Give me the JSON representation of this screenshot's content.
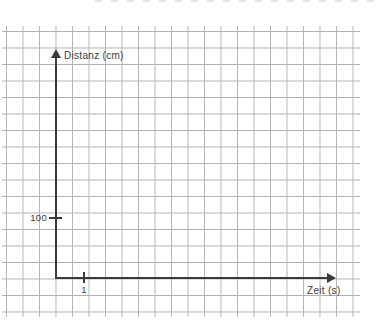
{
  "chart_data": {
    "type": "line",
    "title": "",
    "xlabel": "Zeit (s)",
    "ylabel": "Distanz (cm)",
    "x_tick_labels": [
      "1"
    ],
    "y_tick_labels": [
      "100"
    ],
    "series": [],
    "grid": true,
    "legend": false
  },
  "colors": {
    "background": "#ffffff",
    "grid_line": "#b4b4b4",
    "axis": "#3a3a3a",
    "text": "#3b3b3b"
  }
}
